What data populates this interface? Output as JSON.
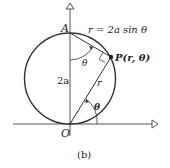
{
  "diagram": {
    "equation": "r = 2a sin θ",
    "point_label": "P(r, θ)",
    "top_label": "A",
    "origin_label": "O",
    "diameter_label": "2a",
    "radius_label": "r",
    "angle_label_top": "θ",
    "angle_label_bottom": "θ",
    "caption": "(b)"
  }
}
